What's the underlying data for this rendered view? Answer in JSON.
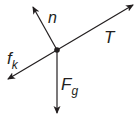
{
  "diagram": {
    "type": "free-body-diagram",
    "stroke_color": "#231f20",
    "background": "#ffffff",
    "center": {
      "x": 57,
      "y": 50
    },
    "forces": [
      {
        "id": "normal",
        "label": "n",
        "subscript": "",
        "tip": {
          "x": 33,
          "y": 7
        },
        "label_pos": {
          "x": 48,
          "y": 22
        }
      },
      {
        "id": "tension",
        "label": "T",
        "subscript": "",
        "tip": {
          "x": 133,
          "y": 5
        },
        "label_pos": {
          "x": 106,
          "y": 42
        }
      },
      {
        "id": "kinetic-friction",
        "label": "f",
        "subscript": "k",
        "tip": {
          "x": 8,
          "y": 79
        },
        "label_pos": {
          "x": 8,
          "y": 64
        }
      },
      {
        "id": "gravity",
        "label": "F",
        "subscript": "g",
        "tip": {
          "x": 57,
          "y": 113
        },
        "label_pos": {
          "x": 61,
          "y": 88
        }
      }
    ]
  }
}
